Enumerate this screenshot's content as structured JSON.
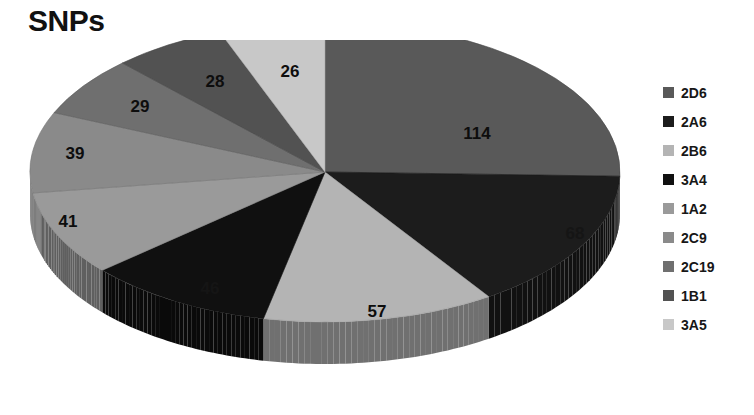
{
  "chart_data": {
    "type": "pie",
    "title": "SNPs",
    "xlabel": "",
    "ylabel": "",
    "legend_position": "right",
    "three_d": true,
    "total": 448,
    "categories": [
      "2D6",
      "2A6",
      "2B6",
      "3A4",
      "1A2",
      "2C9",
      "2C19",
      "1B1",
      "3A5"
    ],
    "values": [
      114,
      68,
      57,
      46,
      41,
      39,
      29,
      28,
      26
    ],
    "data_labels": [
      "114",
      "68",
      "57",
      "46",
      "41",
      "39",
      "29",
      "28",
      "26"
    ],
    "slice_colors": [
      "#595959",
      "#1c1c1c",
      "#b4b4b4",
      "#101010",
      "#9a9a9a",
      "#8a8a8a",
      "#6f6f6f",
      "#525252",
      "#c8c8c8"
    ],
    "start_angle_deg": 0,
    "direction": "clockwise"
  },
  "legend": {
    "items": [
      {
        "label": "2D6",
        "color": "#595959"
      },
      {
        "label": "2A6",
        "color": "#1c1c1c"
      },
      {
        "label": "2B6",
        "color": "#b4b4b4"
      },
      {
        "label": "3A4",
        "color": "#101010"
      },
      {
        "label": "1A2",
        "color": "#9a9a9a"
      },
      {
        "label": "2C9",
        "color": "#8a8a8a"
      },
      {
        "label": "2C19",
        "color": "#6f6f6f"
      },
      {
        "label": "1B1",
        "color": "#525252"
      },
      {
        "label": "3A5",
        "color": "#c8c8c8"
      }
    ]
  }
}
